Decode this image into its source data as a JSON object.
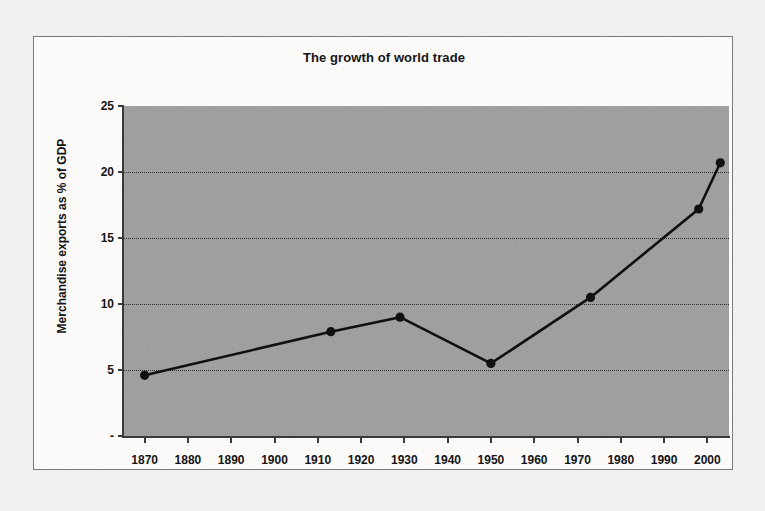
{
  "chart_data": {
    "type": "line",
    "title": "The growth of world trade",
    "xlabel": "",
    "ylabel": "Merchandise exports as % of GDP",
    "xlim": [
      1865,
      2005
    ],
    "ylim": [
      0,
      25
    ],
    "grid": true,
    "legend": "none",
    "plot_background": "#9d9d9d",
    "series_color": "#101010",
    "marker": "circle",
    "x_tick_labels": [
      "1870",
      "1880",
      "1890",
      "1900",
      "1910",
      "1920",
      "1930",
      "1940",
      "1950",
      "1960",
      "1970",
      "1980",
      "1990",
      "2000"
    ],
    "x_tick_values": [
      1870,
      1880,
      1890,
      1900,
      1910,
      1920,
      1930,
      1940,
      1950,
      1960,
      1970,
      1980,
      1990,
      2000
    ],
    "y_tick_labels": [
      "-",
      "5",
      "10",
      "15",
      "20",
      "25"
    ],
    "y_tick_values": [
      0,
      5,
      10,
      15,
      20,
      25
    ],
    "x": [
      1870,
      1913,
      1929,
      1950,
      1973,
      1998,
      2003
    ],
    "values": [
      4.6,
      7.9,
      9.0,
      5.5,
      10.5,
      17.2,
      20.7
    ],
    "points": [
      {
        "x": 1870,
        "y": 4.6
      },
      {
        "x": 1913,
        "y": 7.9
      },
      {
        "x": 1929,
        "y": 9.0
      },
      {
        "x": 1950,
        "y": 5.5
      },
      {
        "x": 1973,
        "y": 10.5
      },
      {
        "x": 1998,
        "y": 17.2
      },
      {
        "x": 2003,
        "y": 20.7
      }
    ]
  }
}
